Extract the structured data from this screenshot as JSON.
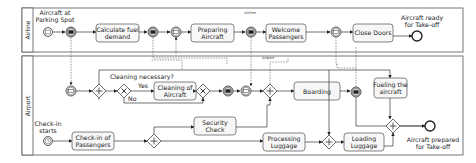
{
  "pools": [
    {
      "id": "airline",
      "label": "Airline",
      "lane_caption": "Airline"
    },
    {
      "id": "airport",
      "label": "Airport",
      "lane_caption": "Airport"
    }
  ],
  "airline": {
    "start_event": "Aircraft at Parking Spot",
    "tasks": [
      "Calculate fuel demand",
      "Preparing Aircraft",
      "Welcome Passengers",
      "Close Doors"
    ],
    "end_event": "Aircraft ready for Take-off"
  },
  "airport": {
    "subprocess_label": "Cleaning necessary?",
    "yes_label": "Yes",
    "no_label": "No",
    "tasks": {
      "cleaning": "Cleaning of Aircraft",
      "boarding": "Boarding",
      "fueling": "Fueling the aircraft",
      "checkin": "Check-in of Passengers",
      "security": "Security Check",
      "processing": "Processing Luggage",
      "loading": "Loading Luggage"
    },
    "start_event": "Check-in starts",
    "end_event": "Aircraft prepared for Take-off"
  },
  "text": {
    "a_start_1": "Aircraft at",
    "a_start_2": "Parking Spot",
    "a_t1_1": "Calculate fuel",
    "a_t1_2": "demand",
    "a_t2_1": "Preparing",
    "a_t2_2": "Aircraft",
    "a_t3_1": "Welcome",
    "a_t3_2": "Passengers",
    "a_t4": "Close Doors",
    "a_end_1": "Aircraft ready",
    "a_end_2": "for Take-off",
    "p_clean_1": "Cleaning of",
    "p_clean_2": "Aircraft",
    "p_fuel_1": "Fueling the",
    "p_fuel_2": "aircraft",
    "p_check_1": "Check-in of",
    "p_check_2": "Passengers",
    "p_sec_1": "Security",
    "p_sec_2": "Check",
    "p_proc_1": "Processing",
    "p_proc_2": "Luggage",
    "p_load_1": "Loading",
    "p_load_2": "Luggage",
    "p_start_1": "Check-in",
    "p_start_2": "starts",
    "p_end_1": "Aircraft prepared",
    "p_end_2": "for Take-off"
  }
}
